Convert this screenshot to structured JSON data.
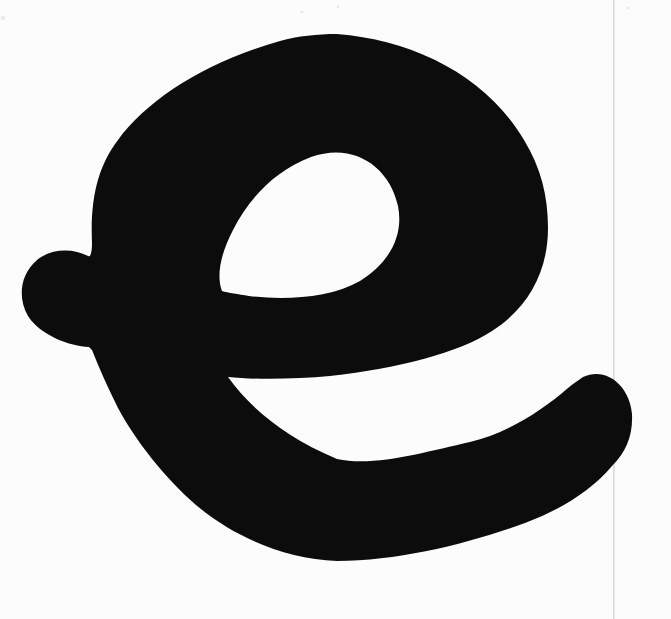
{
  "image": {
    "glyph": "e",
    "description": "Large black bold rounded lowercase letter e scanned on white paper"
  },
  "colors": {
    "ink": "#0c0c0c",
    "paper": "#fcfcfc",
    "scan_line": "#d9d9d9",
    "speckle": "#e9e9e9"
  },
  "artifacts": {
    "scan_line_x": "613"
  }
}
